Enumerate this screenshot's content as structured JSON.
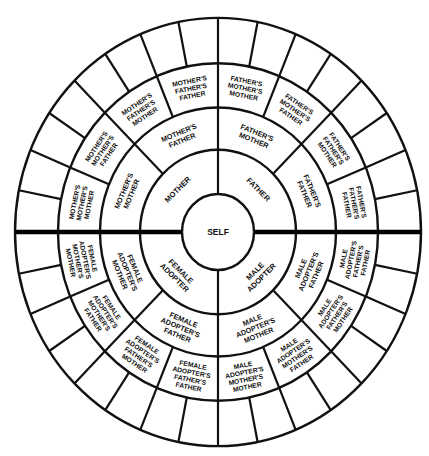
{
  "diagram": {
    "type": "circular-pedigree-chart",
    "center_label": "SELF",
    "colors": {
      "line": "#111111",
      "background": "#ffffff"
    },
    "rings": {
      "generation_1": [
        {
          "label": "FATHER",
          "lines": [
            "FATHER"
          ],
          "start": 0,
          "end": 90
        },
        {
          "label": "MALE ADOPTER",
          "lines": [
            "MALE",
            "ADOPTER"
          ],
          "start": 90,
          "end": 180
        },
        {
          "label": "FEMALE ADOPTER",
          "lines": [
            "FEMALE",
            "ADOPTER"
          ],
          "start": 180,
          "end": 270
        },
        {
          "label": "MOTHER",
          "lines": [
            "MOTHER"
          ],
          "start": 270,
          "end": 360
        }
      ],
      "generation_2": [
        {
          "label": "FATHER'S MOTHER",
          "lines": [
            "FATHER'S",
            "MOTHER"
          ],
          "start": 0,
          "end": 45
        },
        {
          "label": "FATHER'S FATHER",
          "lines": [
            "FATHER'S",
            "FATHER"
          ],
          "start": 45,
          "end": 90
        },
        {
          "label": "MALE ADOPTER'S FATHER",
          "lines": [
            "MALE",
            "ADOPTER'S",
            "FATHER"
          ],
          "start": 90,
          "end": 135
        },
        {
          "label": "MALE ADOPTER'S MOTHER",
          "lines": [
            "MALE",
            "ADOPTER'S",
            "MOTHER"
          ],
          "start": 135,
          "end": 180
        },
        {
          "label": "FEMALE ADOPTER'S FATHER",
          "lines": [
            "FEMALE",
            "ADOPTER'S",
            "FATHER"
          ],
          "start": 180,
          "end": 225
        },
        {
          "label": "FEMALE ADOPTER'S MOTHER",
          "lines": [
            "FEMALE",
            "ADOPTER'S",
            "MOTHER"
          ],
          "start": 225,
          "end": 270
        },
        {
          "label": "MOTHER'S MOTHER",
          "lines": [
            "MOTHER'S",
            "MOTHER"
          ],
          "start": 270,
          "end": 315
        },
        {
          "label": "MOTHER'S FATHER",
          "lines": [
            "MOTHER'S",
            "FATHER"
          ],
          "start": 315,
          "end": 360
        }
      ],
      "generation_3": [
        {
          "label": "FATHER'S MOTHER'S MOTHER",
          "lines": [
            "FATHER'S",
            "MOTHER'S",
            "MOTHER"
          ],
          "start": 0,
          "end": 22.5
        },
        {
          "label": "FATHER'S MOTHER'S FATHER",
          "lines": [
            "FATHER'S",
            "MOTHER'S",
            "FATHER"
          ],
          "start": 22.5,
          "end": 45
        },
        {
          "label": "FATHER'S FATHER'S MOTHER",
          "lines": [
            "FATHER'S",
            "FATHER'S",
            "MOTHER"
          ],
          "start": 45,
          "end": 67.5
        },
        {
          "label": "FATHER'S FATHER'S FATHER",
          "lines": [
            "FATHER'S",
            "FATHER'S",
            "FATHER"
          ],
          "start": 67.5,
          "end": 90
        },
        {
          "label": "MALE ADOPTER'S FATHER'S FATHER",
          "lines": [
            "MALE",
            "ADOPTER'S",
            "FATHER'S",
            "FATHER"
          ],
          "start": 90,
          "end": 112.5
        },
        {
          "label": "MALE ADOPTER'S FATHER'S MOTHER",
          "lines": [
            "MALE",
            "ADOPTER'S",
            "FATHER'S",
            "MOTHER"
          ],
          "start": 112.5,
          "end": 135
        },
        {
          "label": "MALE ADOPTER'S MOTHER'S FATHER",
          "lines": [
            "MALE",
            "ADOPTER'S",
            "MOTHER'S",
            "FATHER"
          ],
          "start": 135,
          "end": 157.5
        },
        {
          "label": "MALE ADOPTER'S MOTHER'S MOTHER",
          "lines": [
            "MALE",
            "ADOPTER'S",
            "MOTHER'S",
            "MOTHER"
          ],
          "start": 157.5,
          "end": 180
        },
        {
          "label": "FEMALE ADOPTER'S FATHER'S FATHER",
          "lines": [
            "FEMALE",
            "ADOPTER'S",
            "FATHER'S",
            "FATHER"
          ],
          "start": 180,
          "end": 202.5
        },
        {
          "label": "FEMALE ADOPTER'S FATHER'S MOTHER",
          "lines": [
            "FEMALE",
            "ADOPTER'S",
            "FATHER'S",
            "MOTHER"
          ],
          "start": 202.5,
          "end": 225
        },
        {
          "label": "FEMALE ADOPTER'S MOTHER'S FATHER",
          "lines": [
            "FEMALE",
            "ADOPTER'S",
            "MOTHER'S",
            "FATHER"
          ],
          "start": 225,
          "end": 247.5
        },
        {
          "label": "FEMALE ADOPTER'S MOTHER'S MOTHER",
          "lines": [
            "FEMALE",
            "ADOPTER'S",
            "MOTHER'S",
            "MOTHER"
          ],
          "start": 247.5,
          "end": 270
        },
        {
          "label": "MOTHER'S MOTHER'S MOTHER",
          "lines": [
            "MOTHER'S",
            "MOTHER'S",
            "MOTHER"
          ],
          "start": 270,
          "end": 292.5
        },
        {
          "label": "MOTHER'S MOTHER'S FATHER",
          "lines": [
            "MOTHER'S",
            "MOTHER'S",
            "FATHER"
          ],
          "start": 292.5,
          "end": 315
        },
        {
          "label": "MOTHER'S FATHER'S MOTHER",
          "lines": [
            "MOTHER'S",
            "FATHER'S",
            "MOTHER"
          ],
          "start": 315,
          "end": 337.5
        },
        {
          "label": "MOTHER'S FATHER'S FATHER",
          "lines": [
            "MOTHER'S",
            "FATHER'S",
            "FATHER"
          ],
          "start": 337.5,
          "end": 360
        }
      ],
      "generation_4": {
        "cells": 32,
        "labels": "blank"
      }
    }
  }
}
